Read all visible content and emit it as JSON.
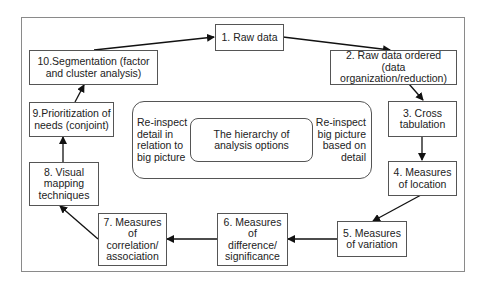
{
  "diagram": {
    "steps": [
      {
        "id": 1,
        "label": "1. Raw data"
      },
      {
        "id": 2,
        "label": "2. Raw data ordered (data\norganization/reduction)"
      },
      {
        "id": 3,
        "label": "3. Cross\ntabulation"
      },
      {
        "id": 4,
        "label": "4. Measures\nof location"
      },
      {
        "id": 5,
        "label": "5. Measures\nof variation"
      },
      {
        "id": 6,
        "label": "6. Measures\nof\ndifference/\nsignificance"
      },
      {
        "id": 7,
        "label": "7. Measures\nof\ncorrelation/\nassociation"
      },
      {
        "id": 8,
        "label": "8. Visual\nmapping\ntechniques"
      },
      {
        "id": 9,
        "label": "9.Prioritization of\nneeds (conjoint)"
      },
      {
        "id": 10,
        "label": "10.Segmentation (factor\nand cluster analysis)"
      }
    ],
    "center": {
      "title": "The hierarchy of\nanalysis options",
      "left_note": "Re-inspect\ndetail in\nrelation to\nbig picture",
      "right_note": "Re-inspect\nbig picture\nbased on\ndetail"
    },
    "flow": [
      "10->1",
      "1->2",
      "2->3",
      "3->4",
      "4->5",
      "5->6",
      "6->7",
      "7->8",
      "8->9",
      "9->10"
    ]
  }
}
